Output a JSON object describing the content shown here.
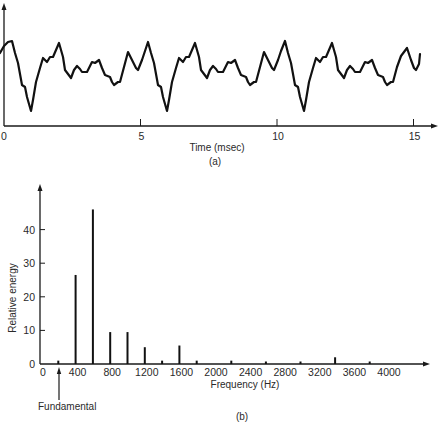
{
  "chart_data": [
    {
      "id": "a",
      "type": "line",
      "title": "",
      "panel_label": "(a)",
      "xlabel": "Time (msec)",
      "ylabel": "",
      "xlim": [
        0,
        15.5
      ],
      "x_ticks": [
        0,
        5,
        10,
        15
      ],
      "x_tick_labels": [
        "0",
        "5",
        "10",
        "15"
      ],
      "y_ticks": [],
      "description": "Periodic speech waveform, period about 5 ms (fundamental about 200 Hz), with a sharp negative dip each period",
      "series": [
        {
          "name": "waveform",
          "points_px": [
            [
              0,
              53
            ],
            [
              4,
              46
            ],
            [
              8,
              42
            ],
            [
              12,
              41
            ],
            [
              15,
              53
            ],
            [
              18,
              63
            ],
            [
              22,
              85
            ],
            [
              25,
              87
            ],
            [
              27,
              97
            ],
            [
              29,
              104
            ],
            [
              31,
              111
            ],
            [
              33,
              100
            ],
            [
              36,
              82
            ],
            [
              40,
              68
            ],
            [
              43,
              58
            ],
            [
              47,
              62
            ],
            [
              50,
              57
            ],
            [
              53,
              57
            ],
            [
              56,
              50
            ],
            [
              59,
              43
            ],
            [
              63,
              57
            ],
            [
              65,
              70
            ],
            [
              68,
              74
            ],
            [
              71,
              78
            ],
            [
              74,
              70
            ],
            [
              77,
              66
            ],
            [
              80,
              69
            ],
            [
              82,
              72
            ],
            [
              87,
              72
            ],
            [
              90,
              66
            ],
            [
              92,
              62
            ],
            [
              95,
              63
            ],
            [
              99,
              60
            ],
            [
              102,
              68
            ],
            [
              105,
              75
            ],
            [
              110,
              77
            ],
            [
              112,
              82
            ],
            [
              114,
              85
            ],
            [
              118,
              82
            ],
            [
              120,
              82
            ],
            [
              124,
              67
            ],
            [
              128,
              52
            ],
            [
              132,
              60
            ],
            [
              136,
              68
            ],
            [
              138,
              70
            ],
            [
              142,
              60
            ],
            [
              145,
              51
            ],
            [
              148,
              42
            ],
            [
              151,
              53
            ],
            [
              154,
              63
            ],
            [
              158,
              85
            ],
            [
              161,
              87
            ],
            [
              163,
              97
            ],
            [
              165,
              104
            ],
            [
              167,
              111
            ],
            [
              169,
              100
            ],
            [
              172,
              82
            ],
            [
              176,
              68
            ],
            [
              179,
              58
            ],
            [
              183,
              62
            ],
            [
              186,
              57
            ],
            [
              189,
              57
            ],
            [
              192,
              50
            ],
            [
              195,
              43
            ],
            [
              199,
              57
            ],
            [
              201,
              70
            ],
            [
              204,
              74
            ],
            [
              207,
              78
            ],
            [
              210,
              70
            ],
            [
              213,
              66
            ],
            [
              216,
              69
            ],
            [
              218,
              72
            ],
            [
              223,
              72
            ],
            [
              226,
              66
            ],
            [
              228,
              62
            ],
            [
              231,
              63
            ],
            [
              235,
              60
            ],
            [
              238,
              68
            ],
            [
              241,
              75
            ],
            [
              246,
              77
            ],
            [
              248,
              82
            ],
            [
              250,
              85
            ],
            [
              254,
              82
            ],
            [
              256,
              82
            ],
            [
              260,
              67
            ],
            [
              264,
              52
            ],
            [
              268,
              60
            ],
            [
              272,
              68
            ],
            [
              274,
              70
            ],
            [
              278,
              60
            ],
            [
              281,
              51
            ],
            [
              285,
              41
            ],
            [
              288,
              53
            ],
            [
              291,
              63
            ],
            [
              295,
              85
            ],
            [
              298,
              87
            ],
            [
              300,
              97
            ],
            [
              302,
              104
            ],
            [
              304,
              111
            ],
            [
              306,
              100
            ],
            [
              309,
              82
            ],
            [
              313,
              68
            ],
            [
              316,
              58
            ],
            [
              320,
              62
            ],
            [
              323,
              57
            ],
            [
              326,
              57
            ],
            [
              329,
              50
            ],
            [
              332,
              43
            ],
            [
              336,
              57
            ],
            [
              338,
              70
            ],
            [
              341,
              74
            ],
            [
              344,
              78
            ],
            [
              347,
              70
            ],
            [
              350,
              66
            ],
            [
              353,
              69
            ],
            [
              355,
              72
            ],
            [
              360,
              72
            ],
            [
              363,
              66
            ],
            [
              365,
              62
            ],
            [
              368,
              63
            ],
            [
              372,
              60
            ],
            [
              375,
              68
            ],
            [
              378,
              75
            ],
            [
              383,
              77
            ],
            [
              385,
              82
            ],
            [
              387,
              85
            ],
            [
              391,
              82
            ],
            [
              393,
              82
            ],
            [
              397,
              67
            ],
            [
              401,
              56
            ],
            [
              404,
              52
            ],
            [
              407,
              48
            ],
            [
              411,
              60
            ],
            [
              414,
              68
            ],
            [
              416,
              70
            ],
            [
              419,
              64
            ],
            [
              420,
              54
            ]
          ]
        }
      ]
    },
    {
      "id": "b",
      "type": "bar",
      "title": "",
      "panel_label": "(b)",
      "xlabel": "Frequency (Hz)",
      "ylabel": "Relative energy",
      "xlim": [
        0,
        4400
      ],
      "ylim": [
        0,
        50
      ],
      "x_ticks": [
        0,
        400,
        800,
        1200,
        1600,
        2000,
        2400,
        2800,
        3200,
        3600,
        4000
      ],
      "x_tick_labels": [
        "0",
        "400",
        "800",
        "1200",
        "1600",
        "2000",
        "2400",
        "2800",
        "3200",
        "3600",
        "4000"
      ],
      "y_ticks": [
        0,
        10,
        20,
        30,
        40
      ],
      "y_tick_labels": [
        "0",
        "10",
        "20",
        "30",
        "40"
      ],
      "categories": [
        200,
        400,
        600,
        800,
        1000,
        1200,
        1400,
        1600,
        1800,
        2200,
        2600,
        3000,
        3400,
        3800
      ],
      "values": [
        1,
        26.5,
        46,
        9.5,
        9.5,
        5,
        1,
        5.5,
        1,
        1,
        0.5,
        0.5,
        2,
        0.5
      ],
      "annotations": [
        {
          "text": "Fundamental",
          "x": 200,
          "arrow": "up"
        }
      ]
    }
  ]
}
